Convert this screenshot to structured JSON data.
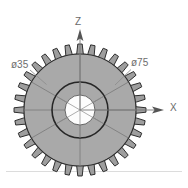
{
  "drawing": {
    "title": "spur-gear-front-view",
    "background_color": "#ffffff",
    "baseline_color": "#d6d6d6"
  },
  "gear": {
    "name": "spur gear",
    "tooth_count": 32,
    "center": {
      "x": 80,
      "y": 110
    },
    "outside_diameter_px": 132,
    "root_diameter_px": 112,
    "pitch_diameter_px": 118,
    "web_diameter_px": 56,
    "bore_diameter_px": 30,
    "spoke_count": 6,
    "body_fill": "#a9a9a9",
    "tooth_fill": "#9e9e9e",
    "bore_fill": "#fdfdfd",
    "outline_color": "#2b2b2b",
    "spoke_line_color": "#6f6f6f"
  },
  "dimensions": [
    {
      "id": "bore-diameter",
      "symbol": "ø",
      "value": "35",
      "text": "ø35",
      "color": "#6d6d6d",
      "leader_from": {
        "x": 30,
        "y": 70
      },
      "leader_to": {
        "x": 46,
        "y": 84
      }
    },
    {
      "id": "outside-diameter",
      "symbol": "ø",
      "value": "75",
      "text": "ø75",
      "color": "#6d6d6d",
      "leader_from": {
        "x": 132,
        "y": 69
      },
      "leader_to": {
        "x": 116,
        "y": 84
      }
    }
  ],
  "axes": [
    {
      "id": "z-axis",
      "label": "Z",
      "direction": "up",
      "color": "#6a6a6a",
      "origin": {
        "x": 80,
        "y": 110
      },
      "tip": {
        "x": 80,
        "y": 31
      }
    },
    {
      "id": "x-axis",
      "label": "X",
      "direction": "right",
      "color": "#6a6a6a",
      "origin": {
        "x": 80,
        "y": 110
      },
      "tip": {
        "x": 163,
        "y": 110
      }
    }
  ]
}
